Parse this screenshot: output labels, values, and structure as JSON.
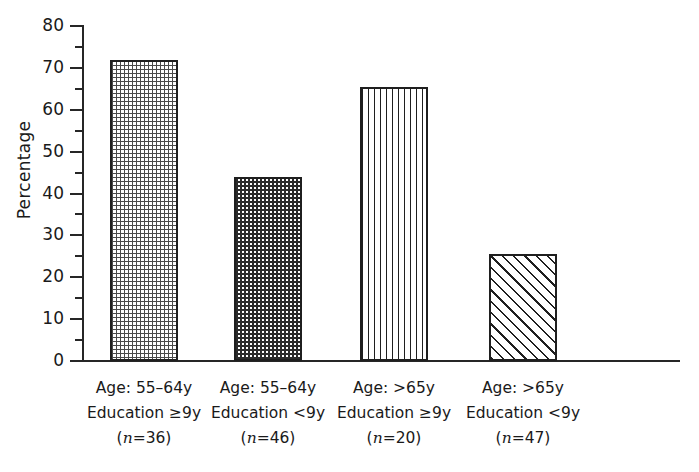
{
  "chart_data": {
    "type": "bar",
    "title": "",
    "xlabel": "",
    "ylabel": "Percentage",
    "ylim": [
      0,
      80
    ],
    "ytick_step": 10,
    "yminor_step": 5,
    "grid": false,
    "legend": "none",
    "categories": [
      "Age: 55-64y Education ≥9y (n=36)",
      "Age: 55-64y Education <9y (n=46)",
      "Age: >65y Education ≥9y (n=20)",
      "Age: >65y Education <9y (n=47)"
    ],
    "values": [
      72,
      44,
      65.5,
      25.5
    ],
    "bar_fills": [
      "fine-dots-light",
      "dense-dots-dark",
      "vertical-lines",
      "diagonal-hatch"
    ],
    "group_n": [
      36,
      46,
      20,
      47
    ]
  },
  "axis": {
    "y_label": "Percentage",
    "y_ticks": [
      "80",
      "70",
      "60",
      "50",
      "40",
      "30",
      "20",
      "10",
      "0"
    ]
  },
  "categories": [
    {
      "age": "Age: 55–64y",
      "education": "Education ≥9y",
      "n_prefix": "(",
      "n_symbol": "n",
      "n_value": "=36)",
      "value": 72
    },
    {
      "age": "Age: 55–64y",
      "education": "Education <9y",
      "n_prefix": "(",
      "n_symbol": "n",
      "n_value": "=46)",
      "value": 44
    },
    {
      "age": "Age: >65y",
      "education": "Education ≥9y",
      "n_prefix": "(",
      "n_symbol": "n",
      "n_value": "=20)",
      "value": 65.5
    },
    {
      "age": "Age: >65y",
      "education": "Education <9y",
      "n_prefix": "(",
      "n_symbol": "n",
      "n_value": "=47)",
      "value": 25.5
    }
  ],
  "colors": {
    "ink": "#1a1a1a",
    "background": "#ffffff"
  }
}
